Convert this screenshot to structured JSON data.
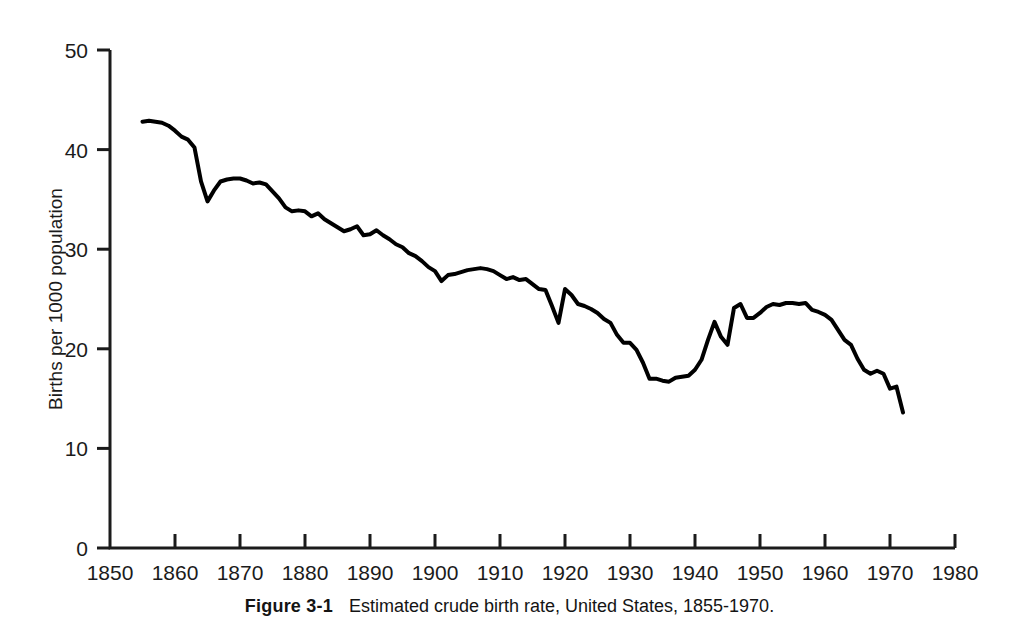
{
  "figure": {
    "caption_label": "Figure 3-1",
    "caption_text": "Estimated crude birth rate, United States, 1855-1970."
  },
  "chart_data": {
    "type": "line",
    "title": "Estimated crude birth rate, United States, 1855-1970.",
    "xlabel": "",
    "ylabel": "Births per 1000 population",
    "xlim": [
      1850,
      1980
    ],
    "ylim": [
      0,
      50
    ],
    "xticks": [
      1850,
      1860,
      1870,
      1880,
      1890,
      1900,
      1910,
      1920,
      1930,
      1940,
      1950,
      1960,
      1970,
      1980
    ],
    "yticks": [
      0,
      10,
      20,
      30,
      40,
      50
    ],
    "xtick_labels": [
      "1850",
      "1860",
      "1870",
      "1880",
      "1890",
      "1900",
      "1910",
      "1920",
      "1930",
      "1940",
      "1950",
      "1960",
      "1970",
      "1980"
    ],
    "ytick_labels": [
      "0",
      "10",
      "20",
      "30",
      "40",
      "50"
    ],
    "grid": false,
    "legend": false,
    "legend_position": "none",
    "line_color": "#000000",
    "line_width": 4,
    "series": [
      {
        "name": "Estimated crude birth rate",
        "x": [
          1855,
          1856,
          1857,
          1858,
          1859,
          1860,
          1861,
          1862,
          1863,
          1864,
          1865,
          1866,
          1867,
          1868,
          1869,
          1870,
          1871,
          1872,
          1873,
          1874,
          1875,
          1876,
          1877,
          1878,
          1879,
          1880,
          1881,
          1882,
          1883,
          1884,
          1885,
          1886,
          1887,
          1888,
          1889,
          1890,
          1891,
          1892,
          1893,
          1894,
          1895,
          1896,
          1897,
          1898,
          1899,
          1900,
          1901,
          1902,
          1903,
          1904,
          1905,
          1906,
          1907,
          1908,
          1909,
          1910,
          1911,
          1912,
          1913,
          1914,
          1915,
          1916,
          1917,
          1918,
          1919,
          1920,
          1921,
          1922,
          1923,
          1924,
          1925,
          1926,
          1927,
          1928,
          1929,
          1930,
          1931,
          1932,
          1933,
          1934,
          1935,
          1936,
          1937,
          1938,
          1939,
          1940,
          1941,
          1942,
          1943,
          1944,
          1945,
          1946,
          1947,
          1948,
          1949,
          1950,
          1951,
          1952,
          1953,
          1954,
          1955,
          1956,
          1957,
          1958,
          1959,
          1960,
          1961,
          1962,
          1963,
          1964,
          1965,
          1966,
          1967,
          1968,
          1969,
          1970,
          1971,
          1972
        ],
        "values": [
          42.8,
          42.9,
          42.8,
          42.7,
          42.4,
          41.9,
          41.3,
          41.0,
          40.2,
          36.8,
          34.8,
          35.9,
          36.8,
          37.0,
          37.1,
          37.1,
          36.9,
          36.6,
          36.7,
          36.5,
          35.8,
          35.1,
          34.2,
          33.8,
          33.9,
          33.8,
          33.3,
          33.6,
          33.0,
          32.6,
          32.2,
          31.8,
          32.0,
          32.3,
          31.4,
          31.5,
          31.9,
          31.4,
          31.0,
          30.5,
          30.2,
          29.6,
          29.3,
          28.8,
          28.2,
          27.8,
          26.8,
          27.4,
          27.5,
          27.7,
          27.9,
          28.0,
          28.1,
          28.0,
          27.8,
          27.4,
          27.0,
          27.2,
          26.9,
          27.0,
          26.5,
          26.0,
          25.9,
          24.3,
          22.6,
          26.0,
          25.4,
          24.5,
          24.3,
          24.0,
          23.6,
          23.0,
          22.6,
          21.4,
          20.6,
          20.6,
          19.9,
          18.6,
          17.0,
          17.0,
          16.8,
          16.7,
          17.1,
          17.2,
          17.3,
          17.9,
          18.9,
          20.9,
          22.7,
          21.2,
          20.4,
          24.1,
          24.5,
          23.1,
          23.1,
          23.6,
          24.2,
          24.5,
          24.4,
          24.6,
          24.6,
          24.5,
          24.6,
          23.9,
          23.7,
          23.4,
          22.9,
          21.9,
          20.9,
          20.4,
          19.0,
          17.9,
          17.5,
          17.8,
          17.5,
          16.0,
          16.2,
          13.6
        ]
      }
    ]
  },
  "axes": {
    "y_axis_title": "Births per 1000 population"
  }
}
